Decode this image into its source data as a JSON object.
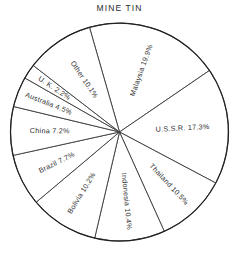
{
  "chart_data": {
    "type": "pie",
    "title": "MINE TIN",
    "xlabel": "",
    "ylabel": "",
    "legend_position": "none",
    "grid": false,
    "units": "percent",
    "start_angle_deg": -106,
    "direction": "clockwise",
    "categories": [
      "Malaysia",
      "U.S.S.R.",
      "Thailand",
      "Indonesia",
      "Bolivia",
      "Brazil",
      "China",
      "Australia",
      "U. K.",
      "Other"
    ],
    "values": [
      19.9,
      17.3,
      10.5,
      10.4,
      10.2,
      7.7,
      7.2,
      4.5,
      2.2,
      10.1
    ],
    "slices": [
      {
        "label": "Malaysia 19.9%",
        "name": "Malaysia",
        "value": 19.9
      },
      {
        "label": "U.S.S.R. 17.3%",
        "name": "U.S.S.R.",
        "value": 17.3
      },
      {
        "label": "Thailand 10.5%",
        "name": "Thailand",
        "value": 10.5
      },
      {
        "label": "Indonesia 10.4%",
        "name": "Indonesia",
        "value": 10.4
      },
      {
        "label": "Bolivia 10.2%",
        "name": "Bolivia",
        "value": 10.2
      },
      {
        "label": "Brazil 7.7%",
        "name": "Brazil",
        "value": 7.7
      },
      {
        "label": "China 7.2%",
        "name": "China",
        "value": 7.2
      },
      {
        "label": "Australia 4.5%",
        "name": "Australia",
        "value": 4.5
      },
      {
        "label": "U. K. 2.2%",
        "name": "U. K.",
        "value": 2.2
      },
      {
        "label": "Other 10.1%",
        "name": "Other",
        "value": 10.1
      }
    ],
    "colors": {
      "slice_fill": "#ffffff",
      "slice_stroke": "#3a3a3a",
      "outline": "#222222",
      "text": "#2e2e2e",
      "background": "#ffffff"
    },
    "geometry": {
      "center_x": 119.5,
      "center_y": 132,
      "radius": 109
    }
  }
}
